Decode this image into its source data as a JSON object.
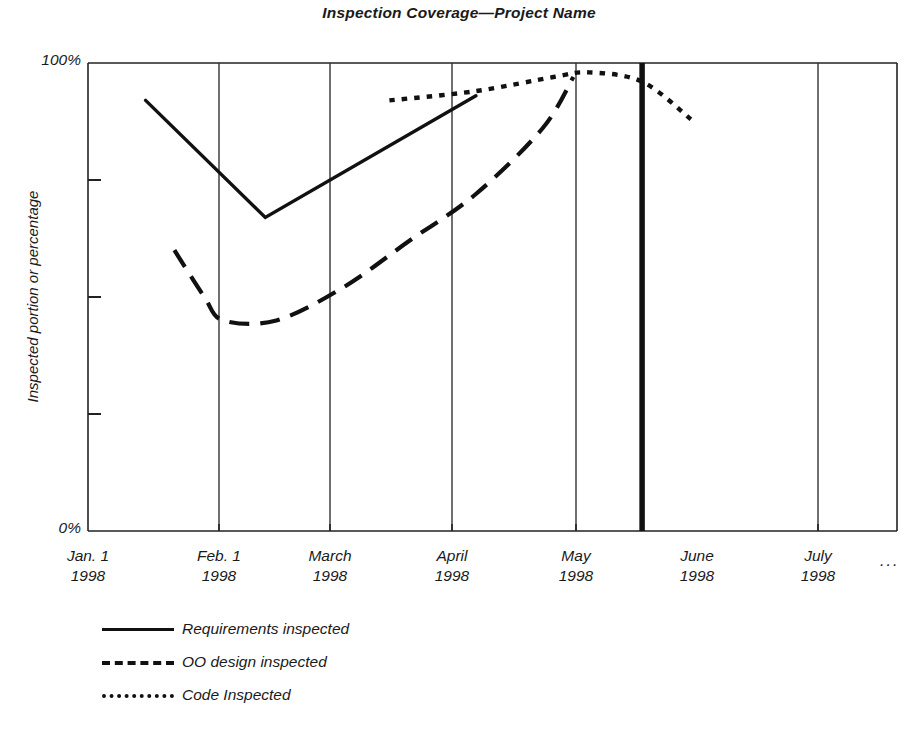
{
  "chart_data": {
    "type": "line",
    "title": "Inspection Coverage—Project Name",
    "xlabel": "",
    "ylabel": "Inspected portion or percentage",
    "ylim": [
      0,
      100
    ],
    "ytick_labels": [
      "100%",
      "0%"
    ],
    "ytick_values": [
      100,
      0
    ],
    "yminor_ticks": [
      25,
      50,
      75
    ],
    "grid": "vertical gridlines at each month boundary",
    "legend_position": "below plot, left aligned",
    "annotations": [
      {
        "name": "today-marker",
        "description": "thick vertical line at June 1998 gridline marking current date",
        "x_label": "June 1998",
        "x_value": 5
      },
      {
        "name": "x-axis-continues",
        "description": "ellipsis after July 1998 indicating the timeline continues",
        "text": "..."
      }
    ],
    "categories": [
      "Jan. 1 1998",
      "Feb. 1 1998",
      "March 1998",
      "April 1998",
      "May 1998",
      "June 1998",
      "July 1998"
    ],
    "xtick_labels": [
      {
        "month": "Jan. 1",
        "year": "1998"
      },
      {
        "month": "Feb. 1",
        "year": "1998"
      },
      {
        "month": "March",
        "year": "1998"
      },
      {
        "month": "April",
        "year": "1998"
      },
      {
        "month": "May",
        "year": "1998"
      },
      {
        "month": "June",
        "year": "1998"
      },
      {
        "month": "July",
        "year": "1998"
      }
    ],
    "series": [
      {
        "name": "Requirements inspected",
        "style": "solid",
        "color": "#111111",
        "points": [
          {
            "x": 0.52,
            "y": 92
          },
          {
            "x": 1.6,
            "y": 67
          },
          {
            "x": 3.5,
            "y": 93
          }
        ]
      },
      {
        "name": "OO design inspected",
        "style": "dashed",
        "color": "#111111",
        "points": [
          {
            "x": 0.78,
            "y": 60
          },
          {
            "x": 1.05,
            "y": 50
          },
          {
            "x": 1.22,
            "y": 45
          },
          {
            "x": 1.7,
            "y": 45
          },
          {
            "x": 2.3,
            "y": 52
          },
          {
            "x": 2.9,
            "y": 62
          },
          {
            "x": 3.5,
            "y": 72
          },
          {
            "x": 4.1,
            "y": 86
          },
          {
            "x": 4.38,
            "y": 97
          }
        ]
      },
      {
        "name": "Code Inspected",
        "style": "dotted",
        "color": "#111111",
        "points": [
          {
            "x": 2.72,
            "y": 92
          },
          {
            "x": 3.5,
            "y": 94
          },
          {
            "x": 4.2,
            "y": 97
          },
          {
            "x": 4.52,
            "y": 98
          },
          {
            "x": 5.0,
            "y": 96
          },
          {
            "x": 5.44,
            "y": 88
          }
        ]
      }
    ]
  },
  "legend": {
    "items": [
      {
        "label": "Requirements inspected",
        "style": "solid"
      },
      {
        "label": "OO design inspected",
        "style": "dashed"
      },
      {
        "label": "Code Inspected",
        "style": "dotted"
      }
    ]
  }
}
